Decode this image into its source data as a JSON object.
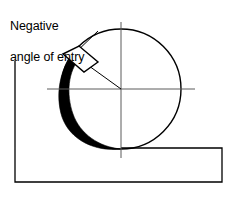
{
  "figure": {
    "kind": "engineering-diagram",
    "background_color": "#ffffff",
    "line_color": "#000000",
    "chip_fill_color": "#000000",
    "tool_fill_color": "#ffffff",
    "centerline_color": "#555555",
    "width": 236,
    "height": 197
  },
  "annotation": {
    "line1": "Negative",
    "line2": "angle of entry",
    "full_text": "Negative angle of entry",
    "leader_from": {
      "x": 97,
      "y": 32
    },
    "leader_to": {
      "x": 72,
      "y": 56
    }
  },
  "cutter": {
    "label": "cutter circle",
    "center": {
      "x": 121,
      "y": 89
    },
    "radius": 60,
    "stroke_width": 1.4
  },
  "centerlines": {
    "horizontal": {
      "x1": 47,
      "y1": 89,
      "x2": 195,
      "y2": 89
    },
    "vertical": {
      "x1": 121,
      "y1": 22,
      "x2": 121,
      "y2": 158
    },
    "stroke_width": 1.0
  },
  "radius_line": {
    "label": "radius to cutting edge",
    "from": {
      "x": 121,
      "y": 89
    },
    "to": {
      "x": 73,
      "y": 54
    }
  },
  "tool_insert": {
    "label": "cutting insert",
    "points": "64,55 79,47 97,62 83,71",
    "stroke_width": 1.4
  },
  "chip": {
    "label": "material chip",
    "description": "thick black crescent of cut material on left side of cutter"
  },
  "workpiece": {
    "label": "L-shaped workpiece",
    "points": "15,61 15,182 222,182 222,148 121,148",
    "stroke_width": 1.3
  }
}
